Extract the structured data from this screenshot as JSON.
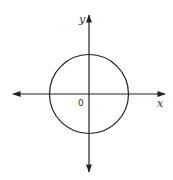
{
  "diagram": {
    "type": "coordinate-plane-with-circle",
    "axes": {
      "x_label": "x",
      "y_label": "y",
      "origin_label": "0",
      "arrows": "both-directions"
    },
    "circle": {
      "center": [
        0,
        0
      ],
      "description": "circle centered at the origin"
    },
    "colors": {
      "stroke": "#222222",
      "background": "#ffffff"
    }
  }
}
